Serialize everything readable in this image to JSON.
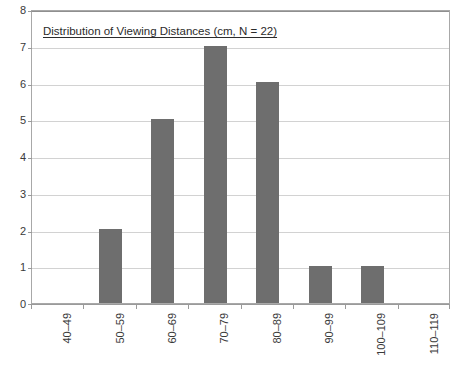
{
  "chart_data": {
    "type": "bar",
    "title": "Distribution of Viewing Distances (cm, N = 22)",
    "xlabel": "",
    "ylabel": "",
    "categories": [
      "40–49",
      "50–59",
      "60–69",
      "70–79",
      "80–89",
      "90–99",
      "100–109",
      "110–119"
    ],
    "values": [
      0,
      2,
      5,
      7,
      6,
      1,
      1,
      0
    ],
    "ylim": [
      0,
      8
    ],
    "ytick_labels": [
      "0",
      "1",
      "2",
      "3",
      "4",
      "5",
      "6",
      "7",
      "8"
    ],
    "ytick_values": [
      0,
      1,
      2,
      3,
      4,
      5,
      6,
      7,
      8
    ],
    "grid": "horizontal",
    "legend": "none",
    "series": [
      {
        "name": "Count",
        "values": [
          0,
          2,
          5,
          7,
          6,
          1,
          1,
          0
        ]
      }
    ]
  },
  "style": {
    "bar_color": "#6e6e6e",
    "gridline_color": "#d2d2d2",
    "axis_color": "#9a9a9a",
    "frame_color": "#a8a8a8",
    "background": "#ffffff",
    "text_color": "#2b2b2b"
  }
}
